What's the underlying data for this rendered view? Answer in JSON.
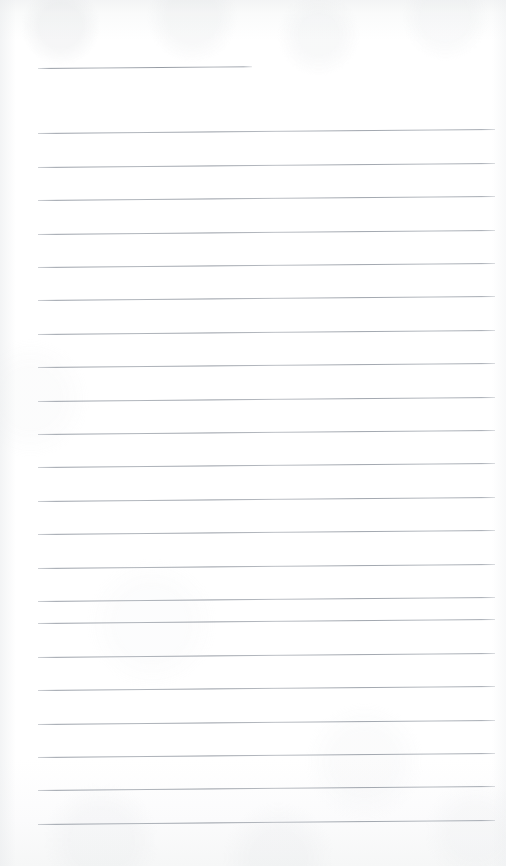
{
  "document": {
    "kind": "scanned-lined-notebook-page",
    "title": "Blank ruled notebook page",
    "content_text": "",
    "page_width": 506,
    "page_height": 866,
    "paper_color": "#fefefe",
    "rule_color": "#99a0a8",
    "has_handwriting": false,
    "has_printed_text": false
  },
  "layout": {
    "left_margin_x": 38,
    "right_edge_x": 495,
    "line_spacing": 33.4,
    "tilt_degrees": -0.5,
    "first_line_y": 68,
    "last_line_y": 824,
    "total_lines": 23
  },
  "lines": [
    {
      "index": 1,
      "y": 68,
      "x": 38,
      "width": 214,
      "kind": "short"
    },
    {
      "index": 2,
      "y": 133,
      "x": 38,
      "width": 457,
      "kind": "full"
    },
    {
      "index": 3,
      "y": 167,
      "x": 38,
      "width": 457,
      "kind": "full"
    },
    {
      "index": 4,
      "y": 200,
      "x": 38,
      "width": 457,
      "kind": "full"
    },
    {
      "index": 5,
      "y": 234,
      "x": 38,
      "width": 457,
      "kind": "full"
    },
    {
      "index": 6,
      "y": 267,
      "x": 38,
      "width": 457,
      "kind": "full"
    },
    {
      "index": 7,
      "y": 300,
      "x": 38,
      "width": 457,
      "kind": "full"
    },
    {
      "index": 8,
      "y": 334,
      "x": 38,
      "width": 457,
      "kind": "full"
    },
    {
      "index": 9,
      "y": 367,
      "x": 38,
      "width": 457,
      "kind": "full"
    },
    {
      "index": 10,
      "y": 401,
      "x": 38,
      "width": 457,
      "kind": "full"
    },
    {
      "index": 11,
      "y": 434,
      "x": 38,
      "width": 457,
      "kind": "full"
    },
    {
      "index": 12,
      "y": 467,
      "x": 38,
      "width": 457,
      "kind": "full"
    },
    {
      "index": 13,
      "y": 501,
      "x": 38,
      "width": 457,
      "kind": "full"
    },
    {
      "index": 14,
      "y": 534,
      "x": 38,
      "width": 457,
      "kind": "full"
    },
    {
      "index": 15,
      "y": 568,
      "x": 38,
      "width": 457,
      "kind": "full"
    },
    {
      "index": 16,
      "y": 601,
      "x": 38,
      "width": 457,
      "kind": "full"
    },
    {
      "index": 17,
      "y": 623,
      "x": 38,
      "width": 457,
      "kind": "full"
    },
    {
      "index": 18,
      "y": 657,
      "x": 38,
      "width": 457,
      "kind": "full"
    },
    {
      "index": 19,
      "y": 690,
      "x": 38,
      "width": 457,
      "kind": "full"
    },
    {
      "index": 20,
      "y": 724,
      "x": 38,
      "width": 457,
      "kind": "full"
    },
    {
      "index": 21,
      "y": 757,
      "x": 38,
      "width": 457,
      "kind": "full"
    },
    {
      "index": 22,
      "y": 790,
      "x": 38,
      "width": 457,
      "kind": "full"
    },
    {
      "index": 23,
      "y": 824,
      "x": 38,
      "width": 457,
      "kind": "full"
    }
  ]
}
